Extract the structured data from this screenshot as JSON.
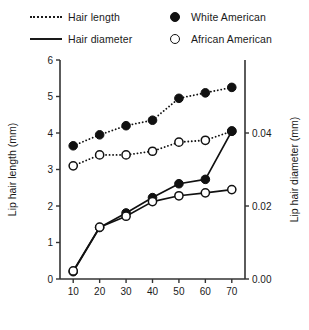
{
  "legend": {
    "items": [
      {
        "label": "Hair length",
        "marker": "dotted-line-icon"
      },
      {
        "label": "White American",
        "marker": "filled-circle-icon"
      },
      {
        "label": "Hair diameter",
        "marker": "solid-line-icon"
      },
      {
        "label": "African American",
        "marker": "open-circle-icon"
      }
    ]
  },
  "chart_data": {
    "type": "line",
    "title": "",
    "xlabel": "Age (years)",
    "ylabel": "Lip hair length (mm)",
    "y2label": "Lip hair diameter (mm)",
    "x": [
      10,
      20,
      30,
      40,
      50,
      60,
      70
    ],
    "xlim": [
      5,
      75
    ],
    "xticks": [
      10,
      20,
      30,
      40,
      50,
      60,
      70
    ],
    "xticklabels": [
      "10",
      "20",
      "30",
      "40",
      "50",
      "60",
      "70"
    ],
    "ylim": [
      0,
      6
    ],
    "yticks": [
      0,
      1,
      2,
      3,
      4,
      5,
      6
    ],
    "yticklabels": [
      "0",
      "1",
      "2",
      "3",
      "4",
      "5",
      "6"
    ],
    "y2lim": [
      0,
      0.06
    ],
    "y2ticks": [
      0.0,
      0.02,
      0.04
    ],
    "y2ticklabels": [
      "0.00",
      "0.02",
      "0.04"
    ],
    "grid": false,
    "legend_position": "above-plot",
    "series": [
      {
        "name": "Hair length - White American",
        "measure": "Hair length",
        "group": "White American",
        "axis": "left",
        "linestyle": "dotted",
        "marker": "filled-circle",
        "color": "#111111",
        "values": [
          3.65,
          3.95,
          4.2,
          4.35,
          4.95,
          5.1,
          5.25
        ]
      },
      {
        "name": "Hair length - African American",
        "measure": "Hair length",
        "group": "African American",
        "axis": "left",
        "linestyle": "dotted",
        "marker": "open-circle",
        "color": "#111111",
        "values": [
          3.1,
          3.4,
          3.4,
          3.5,
          3.75,
          3.8,
          4.05
        ]
      },
      {
        "name": "Hair diameter - White American",
        "measure": "Hair diameter",
        "group": "White American",
        "axis": "right",
        "linestyle": "solid",
        "marker": "filled-circle",
        "color": "#111111",
        "values": [
          0.002,
          0.0141,
          0.0181,
          0.0223,
          0.0261,
          0.0273,
          0.0405
        ]
      },
      {
        "name": "Hair diameter - African American",
        "measure": "Hair diameter",
        "group": "African American",
        "axis": "right",
        "linestyle": "solid",
        "marker": "open-circle",
        "color": "#111111",
        "values": [
          0.0022,
          0.0142,
          0.0172,
          0.0212,
          0.0228,
          0.0236,
          0.0245
        ]
      }
    ]
  }
}
